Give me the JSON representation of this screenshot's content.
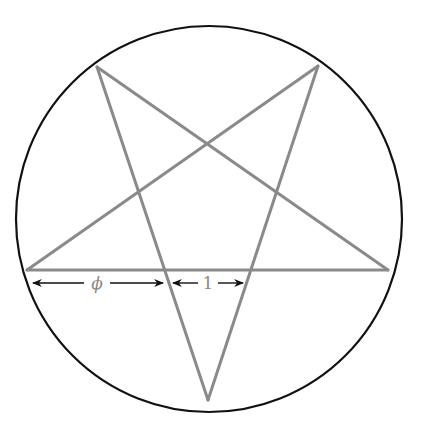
{
  "diagram": {
    "circle": {
      "cx": 209,
      "cy": 219,
      "r": 193,
      "stroke": "#111111",
      "stroke_width": 2.2
    },
    "star": {
      "stroke": "#8a8a8a",
      "stroke_width": 3,
      "vertices": {
        "top_left": [
          97,
          67
        ],
        "top_right": [
          318,
          66
        ],
        "left": [
          27,
          270
        ],
        "right": [
          388,
          270
        ],
        "bottom": [
          208,
          400
        ]
      }
    },
    "annotations": {
      "color": "#111111",
      "label_color": "#8a8a8a",
      "phi_arrow": {
        "x1": 33,
        "x2": 163,
        "y": 283,
        "label": "ϕ",
        "label_x": 97
      },
      "one_arrow": {
        "x1": 173,
        "x2": 243,
        "y": 283,
        "label": "1",
        "label_x": 208
      }
    }
  }
}
